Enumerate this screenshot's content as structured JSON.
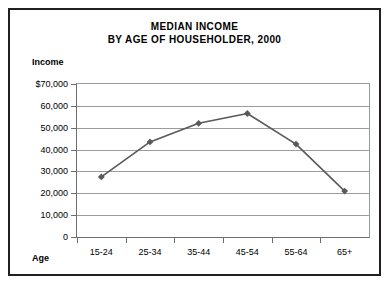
{
  "figure": {
    "title_lines": [
      "MEDIAN INCOME",
      "BY AGE OF HOUSEHOLDER, 2000"
    ],
    "y_axis_name": "Income",
    "x_axis_name": "Age",
    "border_color": "#231f20",
    "grid_color": "#9a9b9d",
    "series_color": "#58595b"
  },
  "chart_data": {
    "type": "line",
    "title": "MEDIAN INCOME BY AGE OF HOUSEHOLDER, 2000",
    "subtitle": "",
    "xlabel": "Age",
    "ylabel": "Income",
    "categories": [
      "15-24",
      "25-34",
      "35-44",
      "45-54",
      "55-64",
      "65+"
    ],
    "values": [
      27500,
      43500,
      52000,
      56500,
      42500,
      21000
    ],
    "ytick_labels": [
      "$70,000",
      "60,000",
      "50,000",
      "40,000",
      "30,000",
      "20,000",
      "10,000",
      "0"
    ],
    "ytick_values": [
      70000,
      60000,
      50000,
      40000,
      30000,
      20000,
      10000,
      0
    ],
    "ylim": [
      0,
      70000
    ],
    "grid": true,
    "legend": "none",
    "marker": "diamond",
    "series_name": "Median income"
  }
}
